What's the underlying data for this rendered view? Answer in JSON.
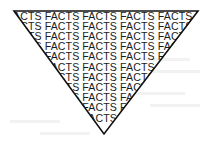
{
  "figure": {
    "shape": "inverted-triangle",
    "fill_word": "FACTS",
    "words_per_row": 7,
    "row_count": 11,
    "text_color": "#1c1c1c",
    "outline_color": "#111111",
    "background_color": "#ffffff"
  }
}
